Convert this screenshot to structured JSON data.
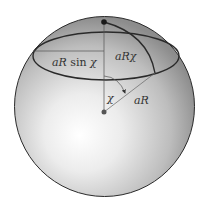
{
  "figure": {
    "labels": {
      "horizontal_radius": "aR sin χ",
      "arc_length": "aRχ",
      "angle": "χ",
      "radius": "aR"
    },
    "label_parts": {
      "horizontal_radius_a": "aR",
      "horizontal_radius_sin": "sin",
      "horizontal_radius_chi": "χ"
    },
    "colors": {
      "sphere_highlight": "#ffffff",
      "sphere_mid": "#d6d6d6",
      "sphere_edge": "#8c8c8c",
      "outline": "#2a2a2a",
      "thin_line": "#555555",
      "point": "#1a1a1a",
      "center_point": "#555555"
    }
  }
}
